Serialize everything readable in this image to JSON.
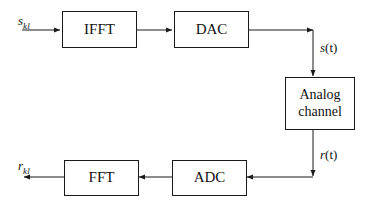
{
  "diagram": {
    "background_color": "#ffffff",
    "line_color": "#1a1a1a",
    "blocks": [
      {
        "id": "ifft",
        "label": "IFFT",
        "label2": ""
      },
      {
        "id": "dac",
        "label": "DAC",
        "label2": ""
      },
      {
        "id": "analog-channel",
        "label": "Analog",
        "label2": "channel"
      },
      {
        "id": "adc",
        "label": "ADC",
        "label2": ""
      },
      {
        "id": "fft",
        "label": "FFT",
        "label2": ""
      }
    ],
    "signals": {
      "input_symbol": "s",
      "input_subscript": "kl",
      "transmit_signal": "s",
      "transmit_arg": "(t)",
      "receive_signal": "r",
      "receive_arg": "(t)",
      "output_symbol": "r",
      "output_subscript": "kl"
    }
  }
}
